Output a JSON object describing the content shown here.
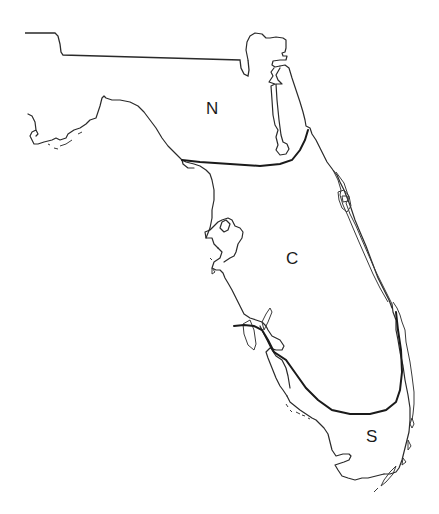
{
  "map": {
    "subject": "Florida",
    "regions": [
      {
        "id": "north",
        "label": "N"
      },
      {
        "id": "central",
        "label": "C"
      },
      {
        "id": "south",
        "label": "S"
      }
    ],
    "colors": {
      "outline": "#2a2a2a",
      "background": "#ffffff"
    }
  }
}
